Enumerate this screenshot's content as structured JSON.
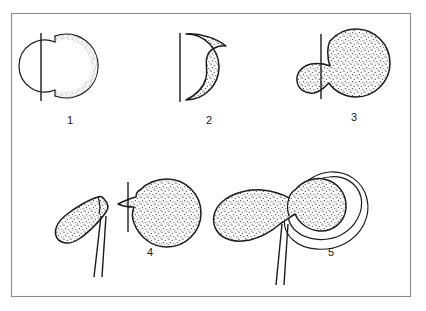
{
  "figure": {
    "background_color": "#ffffff",
    "frame": {
      "x": 11,
      "y": 13,
      "width": 400,
      "height": 284,
      "stroke_color": "#8a8a8a"
    },
    "ink_color": "#1b1b1b",
    "stipple_color": "#3a3a3a",
    "panels": [
      {
        "label": "1",
        "label_x": 70,
        "label_y": 121,
        "description": "thin stippled ring open on the left with vertical rule line"
      },
      {
        "label": "2",
        "label_x": 209,
        "label_y": 121,
        "description": "thick stippled crescent with S-shaped inner notch and vertical rule line"
      },
      {
        "label": "3",
        "label_x": 354,
        "label_y": 118,
        "description": "filled stippled sphere with small left lobe crossed by vertical rule line"
      },
      {
        "label": "4",
        "label_x": 150,
        "label_y": 253,
        "description": "detached stippled teardrop with twin filaments beside a stippled sphere"
      },
      {
        "label": "5",
        "label_x": 331,
        "label_y": 253,
        "description": "stippled dumbbell of two lobes joined by a neck with thin outer envelope and twin filaments"
      }
    ]
  }
}
